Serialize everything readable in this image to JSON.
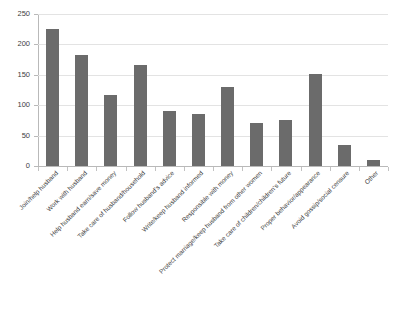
{
  "chart_data": {
    "type": "bar",
    "title": "",
    "subtitle": "",
    "xlabel": "",
    "ylabel": "",
    "ylim": [
      0,
      250
    ],
    "grid": true,
    "legend": false,
    "legend_position": "none",
    "bar_color": "#6b6b6b",
    "gridline_color": "#e3e3e3",
    "axis_color": "#b9b9b9",
    "y_ticks": [
      0,
      50,
      100,
      150,
      200,
      250
    ],
    "y_tick_labels": [
      "0",
      "50",
      "100",
      "150",
      "200",
      "250"
    ],
    "categories": [
      "Join/help husband",
      "Work with husband",
      "Help husband earn/save money",
      "Take care of husband/household",
      "Follow husband's advice",
      "Write/keep husband informed",
      "Responsible with money",
      "Protect marriage/keep husband from other women",
      "Take care of children/children's future",
      "Proper behavior/appearance",
      "Avoid gossip/social censure",
      "Other"
    ],
    "values": [
      225,
      182,
      116,
      166,
      90,
      86,
      130,
      71,
      76,
      152,
      34,
      10
    ]
  }
}
